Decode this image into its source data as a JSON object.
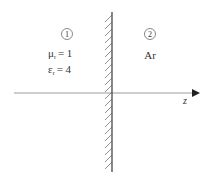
{
  "diagram": {
    "region1": {
      "marker": "1",
      "mu_symbol": "μ",
      "mu_sub": "r",
      "mu_value": "= 1",
      "eps_symbol": "ε",
      "eps_sub": "r",
      "eps_value": "= 4"
    },
    "region2": {
      "marker": "2",
      "label": "Ar"
    },
    "axis": {
      "label": "z"
    },
    "colors": {
      "line": "#555555",
      "axis": "#999999",
      "text": "#333333"
    }
  }
}
